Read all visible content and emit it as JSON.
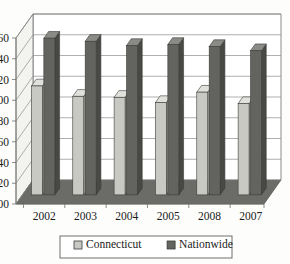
{
  "chart_data": {
    "type": "bar",
    "title": "",
    "subtitle": "",
    "xlabel": "",
    "ylabel": "",
    "categories": [
      "2002",
      "2003",
      "2004",
      "2005",
      "2008",
      "2007"
    ],
    "series": [
      {
        "name": "Connecticut",
        "values": [
          1.05,
          0.95,
          0.94,
          0.89,
          0.99,
          0.88
        ],
        "color": "#c9c9c4"
      },
      {
        "name": "Nationwide",
        "values": [
          1.51,
          1.48,
          1.44,
          1.45,
          1.43,
          1.39
        ],
        "color": "#63635f"
      }
    ],
    "ylim": [
      0.0,
      1.6
    ],
    "ytick_values": [
      0.0,
      0.2,
      0.4,
      0.6,
      0.8,
      1.0,
      1.2,
      1.4,
      1.6
    ],
    "ytick_labels": [
      "0.00",
      "0.20",
      "0.40",
      "0.60",
      "0.80",
      "1.00",
      "1.20",
      "1.40",
      "1.60"
    ],
    "grid": true,
    "legend_position": "bottom",
    "style": "3d-column",
    "legend_entries": [
      {
        "label": "Connecticut",
        "swatch": "#c9c9c4"
      },
      {
        "label": "Nationwide",
        "swatch": "#63635f"
      }
    ]
  },
  "colors": {
    "plot_background": "#fdfdfb",
    "floor": "#6b6b67",
    "gridline": "#8d8d8d",
    "axis": "#6e6e6e",
    "text": "#1b1b1b",
    "legend_border": "#5f5f5b",
    "connecticut": "#c9c9c4",
    "connecticut_side": "#a9a9a4",
    "connecticut_top": "#e0e0dc",
    "nationwide": "#63635f",
    "nationwide_side": "#484845",
    "nationwide_top": "#8a8a86"
  }
}
